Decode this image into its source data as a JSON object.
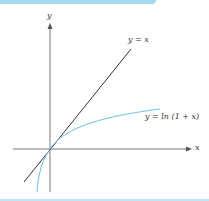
{
  "diagram": {
    "axis_x_label": "x",
    "axis_y_label": "y",
    "line_label": "y = x",
    "curve_label": "y = ln (1 + x)",
    "colors": {
      "axis": "#555555",
      "line": "#333333",
      "curve": "#6cc0e5",
      "accent": "#a6d9f0"
    }
  }
}
